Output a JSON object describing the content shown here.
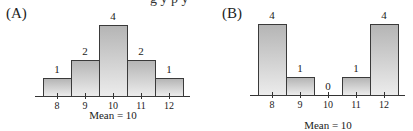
{
  "cropped_top_text": "g y p y",
  "chart_data": [
    {
      "type": "bar",
      "title": "(A)",
      "categories": [
        "8",
        "9",
        "10",
        "11",
        "12"
      ],
      "values": [
        1,
        2,
        4,
        2,
        1
      ],
      "data_labels": [
        "1",
        "2",
        "4",
        "2",
        "1"
      ],
      "xlabel": "Mean = 10",
      "ylabel": "",
      "ylim": [
        0,
        4
      ],
      "grid": false,
      "legend": null
    },
    {
      "type": "bar",
      "title": "(B)",
      "categories": [
        "8",
        "9",
        "10",
        "11",
        "12"
      ],
      "values": [
        4,
        1,
        0,
        1,
        4
      ],
      "data_labels": [
        "4",
        "1",
        "0",
        "1",
        "4"
      ],
      "xlabel": "Mean = 10",
      "ylabel": "",
      "ylim": [
        0,
        4
      ],
      "grid": false,
      "legend": null
    }
  ],
  "style": {
    "bar_outline": "#3a3a3a",
    "bar_top": "#b5b5b5",
    "bar_bottom": "#ececec",
    "axis": "#333333"
  }
}
